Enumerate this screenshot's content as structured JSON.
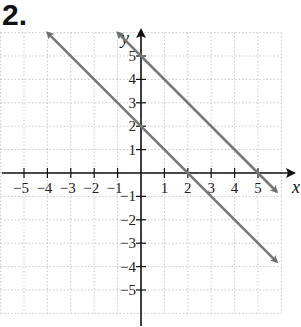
{
  "problem_number": "2.",
  "chart_data": {
    "type": "line",
    "title": "",
    "xlabel": "x",
    "ylabel": "y",
    "xlim": [
      -6,
      6
    ],
    "ylim": [
      -6,
      6
    ],
    "grid": true,
    "x_ticks": [
      -5,
      -4,
      -3,
      -2,
      -1,
      1,
      2,
      3,
      4,
      5
    ],
    "y_ticks": [
      -5,
      -4,
      -3,
      -2,
      -1,
      1,
      2,
      3,
      4,
      5
    ],
    "x_tick_labels": [
      "−5",
      "−4",
      "−3",
      "−2",
      "−1",
      "1",
      "2",
      "3",
      "4",
      "5"
    ],
    "y_tick_labels": [
      "−5",
      "−4",
      "−3",
      "−2",
      "−1",
      "1",
      "2",
      "3",
      "4",
      "5"
    ],
    "series": [
      {
        "name": "y = -x + 5",
        "x": [
          -1,
          5.8
        ],
        "y": [
          6,
          -0.8
        ],
        "color": "#777777",
        "arrows": "both"
      },
      {
        "name": "y = -x + 2",
        "x": [
          -4,
          5.8
        ],
        "y": [
          6,
          -3.8
        ],
        "color": "#777777",
        "arrows": "both"
      }
    ]
  }
}
